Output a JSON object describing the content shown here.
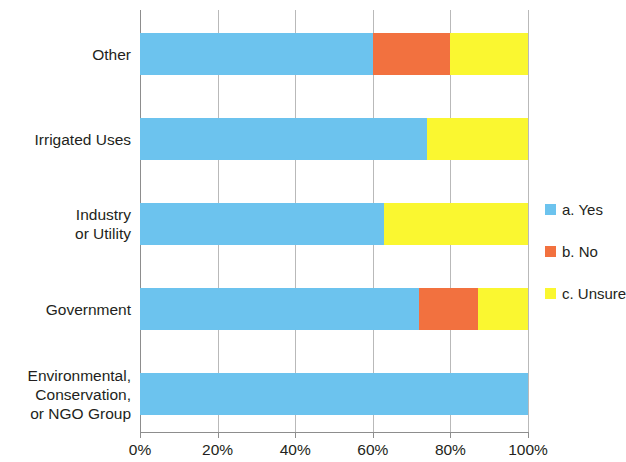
{
  "chart_data": {
    "type": "bar",
    "subtype": "stacked-horizontal-100pct",
    "title": "",
    "xlabel": "",
    "ylabel": "",
    "xlim": [
      0,
      100
    ],
    "xticks": [
      "0%",
      "20%",
      "40%",
      "60%",
      "80%",
      "100%"
    ],
    "xtick_values": [
      0,
      20,
      40,
      60,
      80,
      100
    ],
    "grid": true,
    "legend_position": "right",
    "orientation": "horizontal",
    "categories": [
      "Other",
      "Irrigated Uses",
      "Industry\nor Utility",
      "Government",
      "Environmental,\nConservation,\nor NGO Group"
    ],
    "category_lines": [
      [
        "Other"
      ],
      [
        "Irrigated Uses"
      ],
      [
        "Industry",
        "or Utility"
      ],
      [
        "Government"
      ],
      [
        "Environmental,",
        "Conservation,",
        "or NGO Group"
      ]
    ],
    "series": [
      {
        "name": "a. Yes",
        "color": "#6CC3EE",
        "values": [
          60,
          74,
          63,
          72,
          100
        ]
      },
      {
        "name": "b. No",
        "color": "#F2713F",
        "values": [
          20,
          0,
          0,
          15,
          0
        ]
      },
      {
        "name": "c. Unsure",
        "color": "#FAF730",
        "values": [
          20,
          26,
          37,
          13,
          0
        ]
      }
    ]
  },
  "legend": {
    "items": [
      {
        "label": "a. Yes",
        "color": "#6CC3EE"
      },
      {
        "label": "b. No",
        "color": "#F2713F"
      },
      {
        "label": "c. Unsure",
        "color": "#FAF730"
      }
    ]
  },
  "colors": {
    "yes": "#6CC3EE",
    "no": "#F2713F",
    "unsure": "#FAF730",
    "gridline": "#b9b9b9",
    "axis": "#8d8d8d",
    "text": "#231f20",
    "background": "#ffffff"
  }
}
